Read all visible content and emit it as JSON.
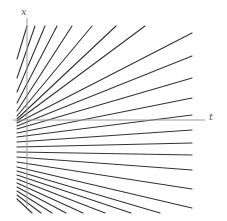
{
  "figure": {
    "title": "",
    "width": 227,
    "height": 221,
    "background_color": "#ffffff"
  },
  "axes": {
    "vertical": {
      "label": "x",
      "color": "#9a9a9a",
      "x": 27,
      "y_top": 18,
      "y_bottom": 207,
      "stroke_width": 1
    },
    "horizontal": {
      "label": "t",
      "color": "#9a9a9a",
      "y": 120,
      "x_left": 13,
      "x_right": 205,
      "stroke_width": 1
    }
  },
  "chart_data": {
    "type": "line",
    "title": "",
    "xlabel": "t",
    "ylabel": "x",
    "grid": false,
    "legend": null,
    "line_color": "#333333",
    "line_width": 1.1,
    "xlim": [
      13,
      205
    ],
    "ylim": [
      0,
      221
    ],
    "fan_origin": {
      "x": 17,
      "y": 120
    },
    "series": [
      {
        "name": "ray-01",
        "x": [
          17,
          27
        ],
        "y": [
          59,
          26
        ]
      },
      {
        "name": "ray-02",
        "x": [
          17,
          35
        ],
        "y": [
          78,
          26
        ]
      },
      {
        "name": "ray-03",
        "x": [
          17,
          45
        ],
        "y": [
          92,
          26
        ]
      },
      {
        "name": "ray-04",
        "x": [
          17,
          57
        ],
        "y": [
          103,
          26
        ]
      },
      {
        "name": "ray-05",
        "x": [
          17,
          72
        ],
        "y": [
          111,
          26
        ]
      },
      {
        "name": "ray-06",
        "x": [
          17,
          92
        ],
        "y": [
          116,
          26
        ]
      },
      {
        "name": "ray-07",
        "x": [
          17,
          116
        ],
        "y": [
          119,
          26
        ]
      },
      {
        "name": "ray-08",
        "x": [
          17,
          145
        ],
        "y": [
          121,
          26
        ]
      },
      {
        "name": "ray-09",
        "x": [
          17,
          192
        ],
        "y": [
          123,
          33
        ]
      },
      {
        "name": "ray-10",
        "x": [
          17,
          192
        ],
        "y": [
          126,
          56
        ]
      },
      {
        "name": "ray-11",
        "x": [
          17,
          192
        ],
        "y": [
          129,
          78
        ]
      },
      {
        "name": "ray-12",
        "x": [
          17,
          192
        ],
        "y": [
          133,
          98
        ]
      },
      {
        "name": "ray-13",
        "x": [
          17,
          192
        ],
        "y": [
          137,
          115
        ]
      },
      {
        "name": "ray-14",
        "x": [
          17,
          192
        ],
        "y": [
          142,
          130
        ]
      },
      {
        "name": "ray-15",
        "x": [
          17,
          192
        ],
        "y": [
          147,
          143
        ]
      },
      {
        "name": "ray-16",
        "x": [
          17,
          192
        ],
        "y": [
          152,
          155
        ]
      },
      {
        "name": "ray-17",
        "x": [
          17,
          192
        ],
        "y": [
          157,
          170
        ]
      },
      {
        "name": "ray-18",
        "x": [
          17,
          192
        ],
        "y": [
          162,
          189
        ]
      },
      {
        "name": "ray-19",
        "x": [
          17,
          192
        ],
        "y": [
          167,
          208
        ]
      },
      {
        "name": "ray-20",
        "x": [
          17,
          160
        ],
        "y": [
          171,
          213
        ]
      },
      {
        "name": "ray-21",
        "x": [
          17,
          131
        ],
        "y": [
          175,
          213
        ]
      },
      {
        "name": "ray-22",
        "x": [
          17,
          105
        ],
        "y": [
          179,
          213
        ]
      },
      {
        "name": "ray-23",
        "x": [
          17,
          83
        ],
        "y": [
          183,
          213
        ]
      },
      {
        "name": "ray-24",
        "x": [
          17,
          66
        ],
        "y": [
          187,
          213
        ]
      },
      {
        "name": "ray-25",
        "x": [
          17,
          52
        ],
        "y": [
          191,
          213
        ]
      },
      {
        "name": "ray-26",
        "x": [
          17,
          41
        ],
        "y": [
          195,
          213
        ]
      },
      {
        "name": "ray-27",
        "x": [
          17,
          32
        ],
        "y": [
          199,
          213
        ]
      }
    ]
  }
}
